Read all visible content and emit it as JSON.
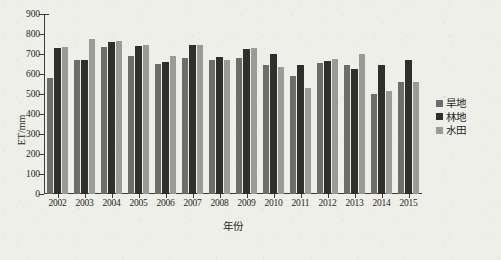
{
  "chart_data": {
    "type": "bar",
    "title": "",
    "subtitle": "",
    "xlabel": "年份",
    "ylabel": "ET/mm",
    "ylim": [
      0,
      900
    ],
    "ytick_step": 100,
    "yticks": [
      0,
      100,
      200,
      300,
      400,
      500,
      600,
      700,
      800,
      900
    ],
    "grid": false,
    "legend_position": "right",
    "categories": [
      "2002",
      "2003",
      "2004",
      "2005",
      "2006",
      "2007",
      "2008",
      "2009",
      "2010",
      "2011",
      "2012",
      "2013",
      "2014",
      "2015"
    ],
    "series": [
      {
        "name": "旱地",
        "color": "#6d6d6b",
        "values": [
          580,
          668,
          737,
          690,
          650,
          680,
          668,
          681,
          643,
          592,
          655,
          644,
          498,
          560
        ]
      },
      {
        "name": "林地",
        "color": "#2f2f2e",
        "values": [
          731,
          672,
          762,
          741,
          660,
          744,
          684,
          723,
          699,
          647,
          663,
          627,
          645,
          672
        ]
      },
      {
        "name": "水田",
        "color": "#9a9a97",
        "values": [
          736,
          775,
          766,
          744,
          692,
          744,
          670,
          730,
          637,
          531,
          676,
          700,
          516,
          560
        ]
      }
    ]
  },
  "legend": {
    "items": [
      {
        "label": "旱地",
        "color": "#6d6d6b"
      },
      {
        "label": "林地",
        "color": "#2f2f2e"
      },
      {
        "label": "水田",
        "color": "#9a9a97"
      }
    ]
  },
  "axes": {
    "y_title": "ET/mm",
    "x_title": "年份"
  }
}
